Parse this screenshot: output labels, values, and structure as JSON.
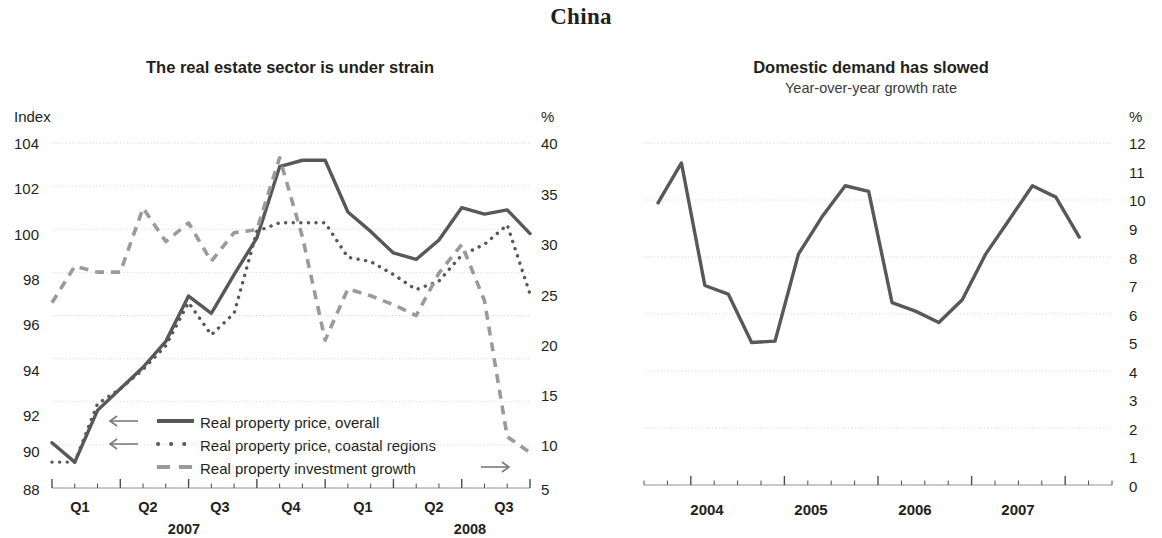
{
  "page": {
    "title": "China"
  },
  "chart_data": [
    {
      "type": "line",
      "panel": "left",
      "title": "The real estate sector is under strain",
      "subtitle": "",
      "xlabel": "",
      "ylabel": "Index",
      "y2label": "%",
      "ylim": [
        88,
        104
      ],
      "y2lim": [
        5,
        40
      ],
      "yticks": [
        "104",
        "102",
        "100",
        "98",
        "96",
        "94",
        "92",
        "90",
        "88"
      ],
      "y2ticks": [
        "40",
        "35",
        "30",
        "25",
        "20",
        "15",
        "10",
        "5"
      ],
      "xtick_labels": [
        "Q1",
        "Q2",
        "Q3",
        "Q4",
        "Q1",
        "Q2",
        "Q3"
      ],
      "xyear_labels": [
        "2007",
        "2008"
      ],
      "grid": true,
      "legend_position": "lower-left-inside",
      "series": [
        {
          "name": "Real property price, overall",
          "axis": "left",
          "arrow": "←",
          "style": "solid",
          "color": "#585858",
          "x": [
            0,
            1,
            2,
            3,
            4,
            5,
            6,
            7,
            8,
            9,
            10,
            11,
            12,
            13,
            14,
            15,
            16,
            17,
            18,
            19,
            20
          ],
          "values": [
            90.1,
            89.2,
            91.6,
            92.6,
            93.6,
            94.8,
            96.9,
            96.1,
            97.9,
            99.6,
            102.9,
            103.2,
            103.2,
            100.8,
            99.9,
            98.9,
            98.6,
            99.5,
            101.0,
            100.7,
            100.9,
            99.8
          ]
        },
        {
          "name": "Real property price, coastal regions",
          "axis": "left",
          "arrow": "←",
          "style": "dotted",
          "color": "#585858",
          "values": [
            89.2,
            89.2,
            91.9,
            92.6,
            93.5,
            94.6,
            96.6,
            95.1,
            96.1,
            99.9,
            100.3,
            100.3,
            100.3,
            98.7,
            98.5,
            97.9,
            97.2,
            97.6,
            98.8,
            99.3,
            100.2,
            97.0
          ]
        },
        {
          "name": "Real property investment growth",
          "axis": "right",
          "arrow": "→",
          "style": "dashed",
          "color": "#9a9a9a",
          "values": [
            23.8,
            27.5,
            26.9,
            26.9,
            33.4,
            30.0,
            31.9,
            28.0,
            30.9,
            31.2,
            38.5,
            30.5,
            20.0,
            25.2,
            24.5,
            23.6,
            22.5,
            26.8,
            29.7,
            24.0,
            10.2,
            8.6
          ]
        }
      ]
    },
    {
      "type": "line",
      "panel": "right",
      "title": "Domestic demand has slowed",
      "subtitle": "Year-over-year growth rate",
      "xlabel": "",
      "ylabel": "",
      "y2label": "%",
      "ylim": [
        0,
        12
      ],
      "yticks": [
        "12",
        "11",
        "10",
        "9",
        "8",
        "7",
        "6",
        "5",
        "4",
        "3",
        "2",
        "1",
        "0"
      ],
      "gridticks": [
        "12",
        "10",
        "8",
        "6",
        "4",
        "2",
        "0"
      ],
      "xtick_labels": [
        "2004",
        "2005",
        "2006",
        "2007"
      ],
      "grid": true,
      "series": [
        {
          "name": "Domestic demand growth",
          "style": "solid",
          "color": "#585858",
          "values": [
            9.9,
            11.3,
            7.0,
            6.7,
            5.0,
            5.05,
            8.1,
            9.4,
            10.5,
            10.3,
            6.4,
            6.1,
            5.7,
            6.5,
            8.1,
            9.3,
            10.5,
            10.1,
            8.7
          ]
        }
      ]
    }
  ],
  "left_chart": {
    "title": "The real estate sector is under strain",
    "y_unit": "Index",
    "y2_unit": "%",
    "legend": [
      {
        "arrow": "←",
        "label": "Real property price, overall"
      },
      {
        "arrow": "←",
        "label": "Real property price, coastal regions"
      },
      {
        "arrow": "→",
        "label": "Real property investment growth"
      }
    ]
  },
  "right_chart": {
    "title": "Domestic demand has slowed",
    "subtitle": "Year-over-year growth rate",
    "y_unit": "%"
  },
  "colors": {
    "solid": "#585858",
    "dashed": "#9a9a9a",
    "grid": "#d8d8dc",
    "text": "#231f20"
  }
}
